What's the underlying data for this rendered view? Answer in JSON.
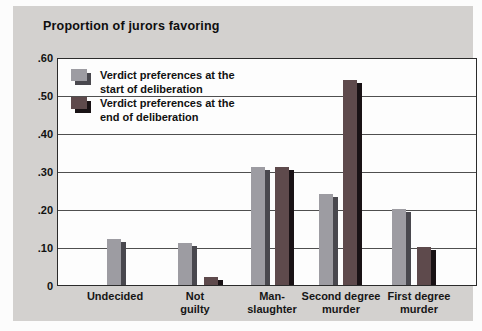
{
  "chart_data": {
    "type": "bar",
    "title": "Proportion of jurors favoring",
    "ylabel": "Proportion of jurors favoring",
    "xlabel": "",
    "ylim": [
      0,
      0.6
    ],
    "grid": true,
    "legend_position": "inside-top-left",
    "categories": [
      "Undecided",
      "Not guilty",
      "Manslaughter",
      "Second degree murder",
      "First degree murder"
    ],
    "category_label_lines": [
      [
        "Undecided"
      ],
      [
        "Not",
        "guilty"
      ],
      [
        "Man-",
        "slaughter"
      ],
      [
        "Second degree",
        "murder"
      ],
      [
        "First degree",
        "murder"
      ]
    ],
    "series": [
      {
        "name": "Verdict preferences at the start of deliberation",
        "legend_lines": [
          "Verdict preferences at the",
          "start of deliberation"
        ],
        "color": "#9d9ca2",
        "shadow_color": "#49484e",
        "values": [
          0.12,
          0.11,
          0.31,
          0.24,
          0.2
        ]
      },
      {
        "name": "Verdict preferences at the end of deliberation",
        "legend_lines": [
          "Verdict preferences at the",
          "end of deliberation"
        ],
        "color": "#5e4a4c",
        "shadow_color": "#191215",
        "values": [
          null,
          0.02,
          0.31,
          0.54,
          0.1
        ]
      }
    ],
    "yticks": [
      {
        "value": 0.6,
        "label": ".60"
      },
      {
        "value": 0.5,
        "label": ".50"
      },
      {
        "value": 0.4,
        "label": ".40"
      },
      {
        "value": 0.3,
        "label": ".30"
      },
      {
        "value": 0.2,
        "label": ".20"
      },
      {
        "value": 0.1,
        "label": ".10"
      },
      {
        "value": 0.0,
        "label": "0"
      }
    ],
    "gridline_values": [
      0.5,
      0.4,
      0.3,
      0.2,
      0.1
    ]
  },
  "colors": {
    "panel_background": "#d3d1cf",
    "plot_background": "#fdfdfd",
    "axis_border": "#2b2b2b",
    "gridline": "#4f4f4f",
    "text": "#111111"
  }
}
